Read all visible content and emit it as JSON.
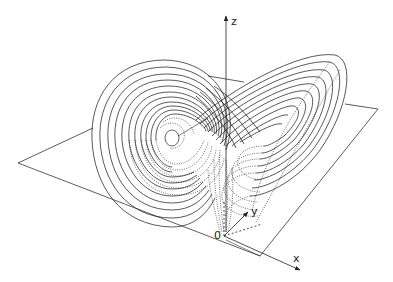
{
  "figure": {
    "axes": {
      "x_label": "x",
      "y_label": "y",
      "z_label": "z",
      "origin_label": "0"
    },
    "colors": {
      "line": "#222222",
      "background": "#ffffff"
    },
    "lobes": [
      {
        "name": "left-lobe",
        "style": "solid outer, dotted inner/lower"
      },
      {
        "name": "right-lobe",
        "style": "solid outer, dotted inner/lower"
      }
    ],
    "plane": {
      "description": "reference plane z = const, drawn as parallelogram"
    }
  }
}
